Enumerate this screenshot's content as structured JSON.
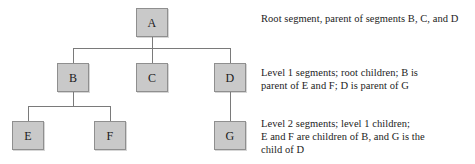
{
  "diagram": {
    "style": {
      "node_fill": "#c9c9c9",
      "node_border": "#8f8f8f",
      "connector_color": "#7a7a7a",
      "text_color": "#1c1c1c",
      "background": "#ffffff"
    },
    "nodes": [
      {
        "id": "A",
        "label": "A",
        "level": 0,
        "x": 136,
        "y": 8,
        "w": 32,
        "h": 29
      },
      {
        "id": "B",
        "label": "B",
        "level": 1,
        "x": 57,
        "y": 63,
        "w": 32,
        "h": 29
      },
      {
        "id": "C",
        "label": "C",
        "level": 1,
        "x": 136,
        "y": 63,
        "w": 32,
        "h": 29
      },
      {
        "id": "D",
        "label": "D",
        "level": 1,
        "x": 214,
        "y": 63,
        "w": 32,
        "h": 29
      },
      {
        "id": "E",
        "label": "E",
        "level": 2,
        "x": 12,
        "y": 121,
        "w": 32,
        "h": 29
      },
      {
        "id": "F",
        "label": "F",
        "level": 2,
        "x": 94,
        "y": 121,
        "w": 32,
        "h": 29
      },
      {
        "id": "G",
        "label": "G",
        "level": 2,
        "x": 214,
        "y": 121,
        "w": 32,
        "h": 29
      }
    ],
    "edges": [
      {
        "from": "A",
        "to": "B"
      },
      {
        "from": "A",
        "to": "C"
      },
      {
        "from": "A",
        "to": "D"
      },
      {
        "from": "B",
        "to": "E"
      },
      {
        "from": "B",
        "to": "F"
      },
      {
        "from": "D",
        "to": "G"
      }
    ],
    "annotations": [
      {
        "id": "level-0-note",
        "text": "Root segment, parent of segments B, C, and D",
        "x": 261,
        "y": 12
      },
      {
        "id": "level-1-note",
        "text": "Level 1 segments; root children; B is\nparent of E and F; D is parent of G",
        "x": 261,
        "y": 66
      },
      {
        "id": "level-2-note",
        "text": "Level 2 segments; level 1 children;\nE and F are children of B, and G is the\nchild of D",
        "x": 261,
        "y": 117
      }
    ]
  }
}
